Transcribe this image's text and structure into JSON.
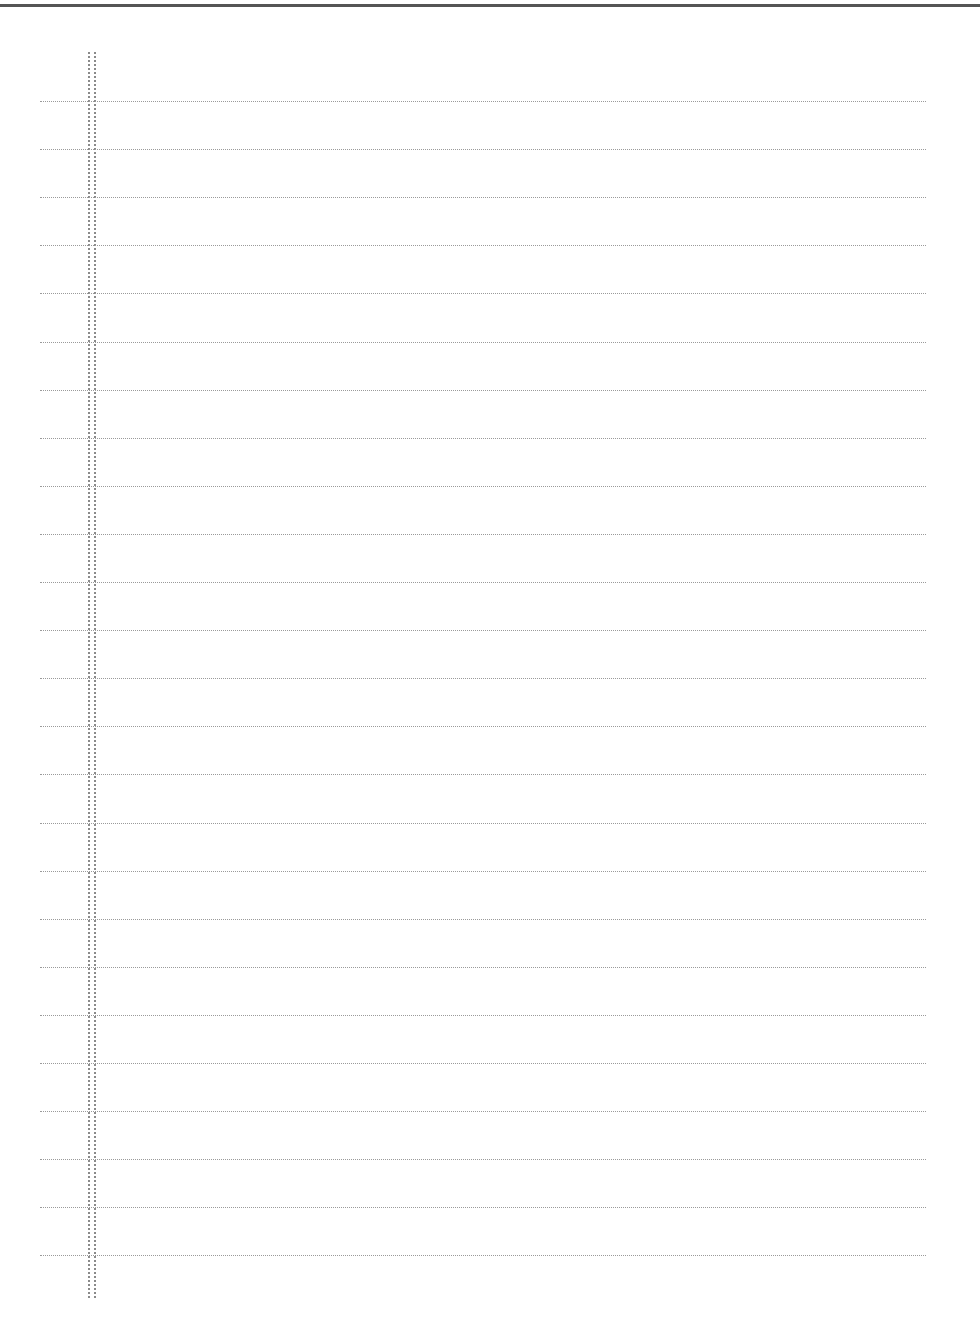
{
  "document": {
    "type": "lined-paper",
    "top_rule_color": "#555555",
    "line_color": "#9a9a9a",
    "margin_color": "#8a8a8a",
    "line_count": 25,
    "first_line_y": 101,
    "line_spacing": 48.1,
    "content": ""
  }
}
